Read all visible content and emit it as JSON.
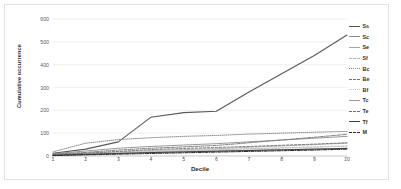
{
  "chart_data": {
    "type": "line",
    "title": "",
    "xlabel": "Decile",
    "ylabel": "Cumulative occurrence",
    "x": [
      1,
      2,
      3,
      4,
      5,
      6,
      7,
      8,
      9,
      10
    ],
    "xticks": [
      "1",
      "2",
      "3",
      "4",
      "5",
      "6",
      "7",
      "8",
      "9",
      "10"
    ],
    "yticks": [
      "0",
      "100",
      "200",
      "300",
      "400",
      "500",
      "600"
    ],
    "ylim": [
      0,
      600
    ],
    "xlim": [
      1,
      10
    ],
    "grid": "horizontal",
    "legend_position": "right",
    "series": [
      {
        "name": "Ss",
        "style": "solid",
        "color": "#595959",
        "width": 1.1,
        "values": [
          12,
          30,
          62,
          170,
          190,
          196,
          280,
          360,
          440,
          530
        ]
      },
      {
        "name": "Sc",
        "style": "solid",
        "color": "#8c8c8c",
        "width": 0.9,
        "values": [
          10,
          22,
          34,
          42,
          48,
          54,
          62,
          70,
          78,
          86
        ]
      },
      {
        "name": "Se",
        "style": "solid",
        "color": "#a6a6a6",
        "width": 0.8,
        "values": [
          6,
          12,
          18,
          24,
          28,
          32,
          38,
          44,
          50,
          56
        ]
      },
      {
        "name": "Sf",
        "style": "dashed",
        "color": "#b3b3b3",
        "width": 0.8,
        "values": [
          4,
          9,
          14,
          19,
          23,
          27,
          31,
          35,
          39,
          43
        ]
      },
      {
        "name": "Bc",
        "style": "dotted",
        "color": "#808080",
        "width": 0.9,
        "values": [
          18,
          56,
          72,
          80,
          86,
          90,
          96,
          100,
          104,
          108
        ]
      },
      {
        "name": "Be",
        "style": "dashdot",
        "color": "#707070",
        "width": 0.9,
        "values": [
          8,
          16,
          26,
          34,
          40,
          46,
          58,
          70,
          82,
          95
        ]
      },
      {
        "name": "Bf",
        "style": "dotted",
        "color": "#c0c0c0",
        "width": 0.8,
        "values": [
          5,
          10,
          15,
          20,
          24,
          28,
          32,
          36,
          40,
          44
        ]
      },
      {
        "name": "Tc",
        "style": "solid",
        "color": "#999999",
        "width": 0.8,
        "values": [
          4,
          8,
          12,
          16,
          19,
          22,
          25,
          28,
          31,
          34
        ]
      },
      {
        "name": "Te",
        "style": "dashed",
        "color": "#6e6e6e",
        "width": 0.9,
        "values": [
          6,
          12,
          20,
          28,
          33,
          37,
          42,
          47,
          52,
          58
        ]
      },
      {
        "name": "Tf",
        "style": "solid",
        "color": "#3f3f3f",
        "width": 1.0,
        "values": [
          3,
          7,
          11,
          15,
          18,
          21,
          24,
          27,
          30,
          33
        ]
      },
      {
        "name": "M",
        "style": "dashdot",
        "color": "#262626",
        "width": 1.0,
        "values": [
          2,
          5,
          8,
          11,
          14,
          17,
          20,
          23,
          26,
          30
        ]
      }
    ]
  },
  "legend": {
    "items": [
      "Ss",
      "Sc",
      "Se",
      "Sf",
      "Bc",
      "Be",
      "Bf",
      "Tc",
      "Te",
      "Tf",
      "M"
    ]
  },
  "axes": {
    "y_title": "Cumulative occurrence",
    "x_title": "Decile"
  }
}
